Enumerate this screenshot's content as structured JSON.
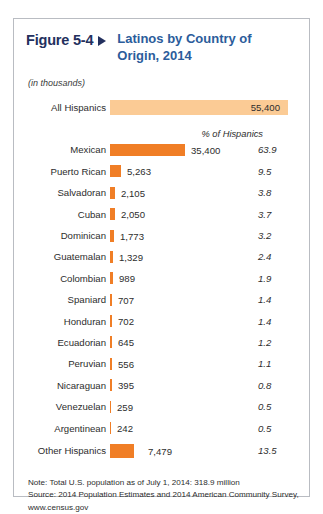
{
  "figure": {
    "number": "Figure 5-4",
    "arrow_icon": "triangle-right-icon",
    "title": "Latinos by Country of Origin, 2014",
    "units_note": "(in thousands)",
    "percent_column_header": "% of Hispanics"
  },
  "total_row": {
    "label": "All Hispanics",
    "value": "55,400"
  },
  "footnotes": [
    "Note: Total U.S. population as of July 1, 2014:  318.9 million",
    "Source: 2014 Population Estimates and 2014 American Community Survey,",
    "www.census.gov"
  ],
  "colors": {
    "bar": "#f07e26",
    "total_bar": "#fbcb95",
    "figure_number": "#23305e",
    "title": "#2b5c9b",
    "frame": "#b9bcc2"
  },
  "chart_data": {
    "type": "bar",
    "title": "Latinos by Country of Origin, 2014",
    "subtitle": "(in thousands)",
    "xlabel": "",
    "ylabel": "",
    "orientation": "horizontal",
    "grid": false,
    "legend": false,
    "units": "thousands",
    "value_axis_max": 35400,
    "total": {
      "category": "All Hispanics",
      "value": 55400,
      "value_label": "55,400",
      "percent": null,
      "percent_label": ""
    },
    "columns": [
      "Country of Origin",
      "Population (thousands)",
      "% of Hispanics"
    ],
    "categories": [
      "Mexican",
      "Puerto Rican",
      "Salvadoran",
      "Cuban",
      "Dominican",
      "Guatemalan",
      "Colombian",
      "Spaniard",
      "Honduran",
      "Ecuadorian",
      "Peruvian",
      "Nicaraguan",
      "Venezuelan",
      "Argentinean",
      "Other Hispanics"
    ],
    "values": [
      35400,
      5263,
      2105,
      2050,
      1773,
      1329,
      989,
      707,
      702,
      645,
      556,
      395,
      259,
      242,
      7479
    ],
    "percents": [
      63.9,
      9.5,
      3.8,
      3.7,
      3.2,
      2.4,
      1.9,
      1.4,
      1.4,
      1.2,
      1.1,
      0.8,
      0.5,
      0.5,
      13.5
    ],
    "rows": [
      {
        "label": "Mexican",
        "value": 35400,
        "value_label": "35,400",
        "percent": 63.9,
        "percent_label": "63.9",
        "bar_px": 75
      },
      {
        "label": "Puerto Rican",
        "value": 5263,
        "value_label": "5,263",
        "percent": 9.5,
        "percent_label": "9.5",
        "bar_px": 11
      },
      {
        "label": "Salvadoran",
        "value": 2105,
        "value_label": "2,105",
        "percent": 3.8,
        "percent_label": "3.8",
        "bar_px": 5
      },
      {
        "label": "Cuban",
        "value": 2050,
        "value_label": "2,050",
        "percent": 3.7,
        "percent_label": "3.7",
        "bar_px": 5
      },
      {
        "label": "Dominican",
        "value": 1773,
        "value_label": "1,773",
        "percent": 3.2,
        "percent_label": "3.2",
        "bar_px": 4
      },
      {
        "label": "Guatemalan",
        "value": 1329,
        "value_label": "1,329",
        "percent": 2.4,
        "percent_label": "2.4",
        "bar_px": 3
      },
      {
        "label": "Colombian",
        "value": 989,
        "value_label": "989",
        "percent": 1.9,
        "percent_label": "1.9",
        "bar_px": 3
      },
      {
        "label": "Spaniard",
        "value": 707,
        "value_label": "707",
        "percent": 1.4,
        "percent_label": "1.4",
        "bar_px": 2
      },
      {
        "label": "Honduran",
        "value": 702,
        "value_label": "702",
        "percent": 1.4,
        "percent_label": "1.4",
        "bar_px": 2
      },
      {
        "label": "Ecuadorian",
        "value": 645,
        "value_label": "645",
        "percent": 1.2,
        "percent_label": "1.2",
        "bar_px": 2
      },
      {
        "label": "Peruvian",
        "value": 556,
        "value_label": "556",
        "percent": 1.1,
        "percent_label": "1.1",
        "bar_px": 2
      },
      {
        "label": "Nicaraguan",
        "value": 395,
        "value_label": "395",
        "percent": 0.8,
        "percent_label": "0.8",
        "bar_px": 2
      },
      {
        "label": "Venezuelan",
        "value": 259,
        "value_label": "259",
        "percent": 0.5,
        "percent_label": "0.5",
        "bar_px": 1
      },
      {
        "label": "Argentinean",
        "value": 242,
        "value_label": "242",
        "percent": 0.5,
        "percent_label": "0.5",
        "bar_px": 1
      },
      {
        "label": "Other Hispanics",
        "value": 7479,
        "value_label": "7,479",
        "percent": 13.5,
        "percent_label": "13.5",
        "bar_px": 24
      }
    ],
    "notes": [
      "Note: Total U.S. population as of July 1, 2014:  318.9 million",
      "Source: 2014 Population Estimates and 2014 American Community Survey,",
      "www.census.gov"
    ]
  }
}
